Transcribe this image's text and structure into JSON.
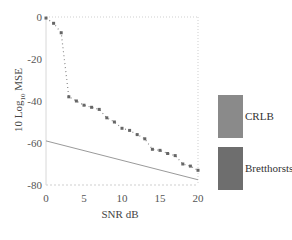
{
  "chart_data": {
    "type": "line",
    "title": "",
    "xlabel": "SNR dB",
    "ylabel": "10 Log10 MSE",
    "ylabel_main": "10 Log",
    "ylabel_sub": "10",
    "ylabel_tail": " MSE",
    "xlim": [
      0,
      20
    ],
    "ylim": [
      -80,
      0
    ],
    "xticks": [
      0,
      5,
      10,
      15,
      20
    ],
    "yticks": [
      0,
      -20,
      -40,
      -60,
      -80
    ],
    "grid": false,
    "legend_position": "right",
    "x": [
      0,
      1,
      2,
      3,
      4,
      5,
      6,
      7,
      8,
      9,
      10,
      11,
      12,
      13,
      14,
      15,
      16,
      17,
      18,
      19,
      20
    ],
    "series": [
      {
        "name": "CRLB",
        "style": "solid",
        "color": "#8a8a8a",
        "x": [
          0,
          20
        ],
        "values": [
          -59,
          -77.5
        ]
      },
      {
        "name": "Bretthorsts'",
        "style": "dotted-markers",
        "color": "#6e6e6e",
        "x": [
          0,
          1,
          2,
          3,
          4,
          5,
          6,
          7,
          8,
          9,
          10,
          11,
          12,
          13,
          14,
          15,
          16,
          17,
          18,
          19,
          20
        ],
        "values": [
          -0.5,
          -3,
          -7.5,
          -38,
          -40,
          -42,
          -43,
          -44,
          -48,
          -50,
          -53,
          -54,
          -56,
          -58,
          -63,
          -63.5,
          -65,
          -66,
          -70,
          -71,
          -73
        ]
      }
    ]
  },
  "legend": {
    "items": [
      {
        "label": "CRLB",
        "color": "#8a8a8a"
      },
      {
        "label": "Bretthorsts'",
        "color": "#6e6e6e"
      }
    ]
  }
}
